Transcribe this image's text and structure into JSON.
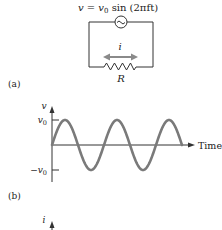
{
  "figure": {
    "equation": {
      "lhs": "v",
      "eq": " = ",
      "v0_base": "v",
      "v0_sub": "0",
      "rest": " sin (2πft)"
    },
    "circuit": {
      "source_symbol": "~",
      "current_label": "i",
      "resistor_label": "R",
      "wire_color": "#333333",
      "arrow_color": "#8a8a8a"
    },
    "panel_a_label": "(a)",
    "panel_b_label": "(b)",
    "next_axis_label": "i"
  },
  "chart_data": {
    "type": "line",
    "title": "",
    "xlabel": "Time",
    "ylabel": "v",
    "y_ticks": [
      {
        "value": 1,
        "label_base": "v",
        "label_sub": "0",
        "label_prefix": ""
      },
      {
        "value": -1,
        "label_base": "v",
        "label_sub": "0",
        "label_prefix": "−"
      }
    ],
    "ylim": [
      -1.35,
      1.35
    ],
    "xlim": [
      0,
      2.75
    ],
    "series": [
      {
        "name": "v = v0 sin(2πft)",
        "function": "sin",
        "amplitude": 1,
        "cycles": 2.5,
        "color": "#7a7a7a"
      }
    ],
    "grid": false,
    "legend": "none"
  }
}
